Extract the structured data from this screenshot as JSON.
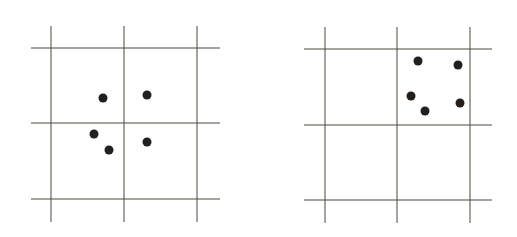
{
  "colors": {
    "background": "#ffffff",
    "grid_line": "#4a4a3e",
    "dot": "#231f1d"
  },
  "panels": [
    {
      "name": "left-grid",
      "vlines": [
        51,
        124,
        197
      ],
      "hlines": [
        48,
        123,
        199
      ],
      "x_range": [
        31,
        220
      ],
      "y_range": [
        26,
        222
      ],
      "dots": [
        [
          103,
          98
        ],
        [
          147,
          95
        ],
        [
          94,
          134
        ],
        [
          109,
          150
        ],
        [
          147,
          142
        ]
      ]
    },
    {
      "name": "right-grid",
      "vlines": [
        325,
        397,
        470
      ],
      "hlines": [
        49,
        125,
        200
      ],
      "x_range": [
        304,
        492
      ],
      "y_range": [
        27,
        223
      ],
      "dots": [
        [
          418,
          61
        ],
        [
          458,
          65
        ],
        [
          411,
          96
        ],
        [
          425,
          111
        ],
        [
          460,
          103
        ]
      ]
    }
  ],
  "dot_radius": 4.5
}
